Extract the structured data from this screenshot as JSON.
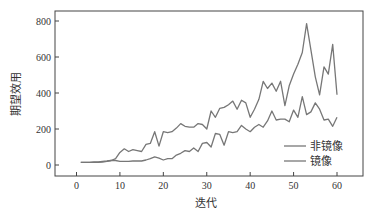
{
  "chart_data": {
    "type": "line",
    "title": "",
    "xlabel": "迭代",
    "ylabel": "期望效用",
    "xlim": [
      -5,
      66
    ],
    "ylim": [
      -60,
      870
    ],
    "xticks": [
      0,
      10,
      20,
      30,
      40,
      50,
      60
    ],
    "yticks": [
      0,
      200,
      400,
      600,
      800
    ],
    "grid": false,
    "legend_position": "lower right",
    "x": [
      1,
      2,
      3,
      4,
      5,
      6,
      7,
      8,
      9,
      10,
      11,
      12,
      13,
      14,
      15,
      16,
      17,
      18,
      19,
      20,
      21,
      22,
      23,
      24,
      25,
      26,
      27,
      28,
      29,
      30,
      31,
      32,
      33,
      34,
      35,
      36,
      37,
      38,
      39,
      40,
      41,
      42,
      43,
      44,
      45,
      46,
      47,
      48,
      49,
      50,
      51,
      52,
      53,
      54,
      55,
      56,
      57,
      58,
      59,
      60
    ],
    "series": [
      {
        "name": "非镜像",
        "color": "#777777",
        "values": [
          15,
          15,
          15,
          17,
          18,
          20,
          22,
          25,
          35,
          70,
          90,
          75,
          85,
          80,
          75,
          115,
          120,
          185,
          105,
          185,
          180,
          185,
          205,
          230,
          215,
          210,
          210,
          230,
          225,
          200,
          300,
          265,
          315,
          320,
          335,
          355,
          310,
          360,
          345,
          265,
          310,
          365,
          465,
          425,
          455,
          410,
          465,
          330,
          440,
          505,
          560,
          625,
          785,
          640,
          490,
          390,
          545,
          505,
          670,
          390
        ]
      },
      {
        "name": "镜像",
        "color": "#777777",
        "values": [
          15,
          15,
          15,
          15,
          15,
          16,
          20,
          25,
          25,
          20,
          20,
          20,
          22,
          22,
          22,
          28,
          35,
          45,
          38,
          28,
          35,
          35,
          55,
          65,
          80,
          75,
          95,
          75,
          120,
          125,
          100,
          175,
          170,
          110,
          185,
          180,
          185,
          220,
          200,
          185,
          210,
          225,
          210,
          245,
          300,
          250,
          255,
          255,
          240,
          305,
          265,
          380,
          280,
          295,
          345,
          310,
          250,
          255,
          215,
          265
        ]
      }
    ]
  },
  "legend": {
    "items": [
      {
        "label": "非镜像"
      },
      {
        "label": "镜像"
      }
    ]
  },
  "axes": {
    "xlabel": "迭代",
    "ylabel": "期望效用",
    "xtick_labels": [
      "0",
      "10",
      "20",
      "30",
      "40",
      "50",
      "60"
    ],
    "ytick_labels": [
      "0",
      "200",
      "400",
      "600",
      "800"
    ]
  }
}
